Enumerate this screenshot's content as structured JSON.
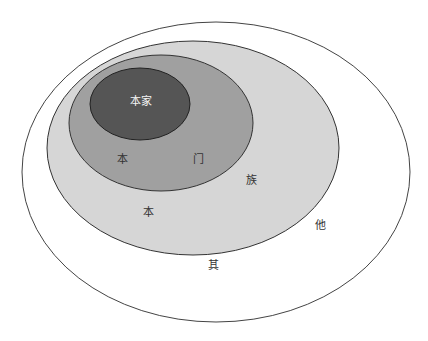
{
  "diagram": {
    "type": "nested-ellipses",
    "colors": {
      "outer": "#ffffff",
      "zu": "#d6d6d6",
      "men": "#a0a0a0",
      "jia": "#555555",
      "stroke": "#333333"
    },
    "regions": [
      {
        "name": "qita",
        "chars": [
          "其",
          "他"
        ]
      },
      {
        "name": "benzu",
        "chars": [
          "本",
          "族"
        ]
      },
      {
        "name": "benmen",
        "chars": [
          "本",
          "门"
        ]
      },
      {
        "name": "benjia",
        "label": "本家"
      }
    ],
    "labels": {
      "benjia": "本家",
      "benmen_ben": "本",
      "benmen_men": "门",
      "benzu_ben": "本",
      "benzu_zu": "族",
      "qita_qi": "其",
      "qita_ta": "他"
    }
  }
}
